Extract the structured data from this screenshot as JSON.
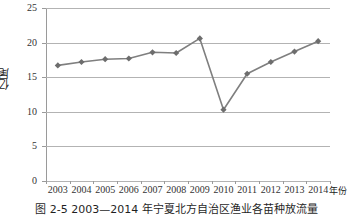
{
  "figure": {
    "caption": "图 2-5  2003—2014 年宁夏北方自治区渔业各苗种放流量"
  },
  "chart_data": {
    "type": "line",
    "title": "",
    "xlabel": "年份",
    "ylabel": "亿尾",
    "categories": [
      "2003",
      "2004",
      "2005",
      "2006",
      "2007",
      "2008",
      "2009",
      "2010",
      "2011",
      "2012",
      "2013",
      "2014"
    ],
    "values": [
      16.7,
      17.2,
      17.6,
      17.7,
      18.6,
      18.5,
      20.6,
      10.3,
      15.5,
      17.2,
      18.7,
      20.2
    ],
    "series": [
      {
        "name": "放流量",
        "values": [
          16.7,
          17.2,
          17.6,
          17.7,
          18.6,
          18.5,
          20.6,
          10.3,
          15.5,
          17.2,
          18.7,
          20.2
        ]
      }
    ],
    "ylim": [
      0,
      25
    ],
    "yticks": [
      0,
      5,
      10,
      15,
      20,
      25
    ],
    "ytick_labels": [
      "0",
      "5",
      "10",
      "15",
      "20",
      "25"
    ],
    "grid": true,
    "legend": false,
    "marker": "diamond",
    "line_color": "#7f7f7f",
    "marker_color": "#6d6d6d",
    "grid_color": "#b3b3b3",
    "background": "#ffffff"
  }
}
